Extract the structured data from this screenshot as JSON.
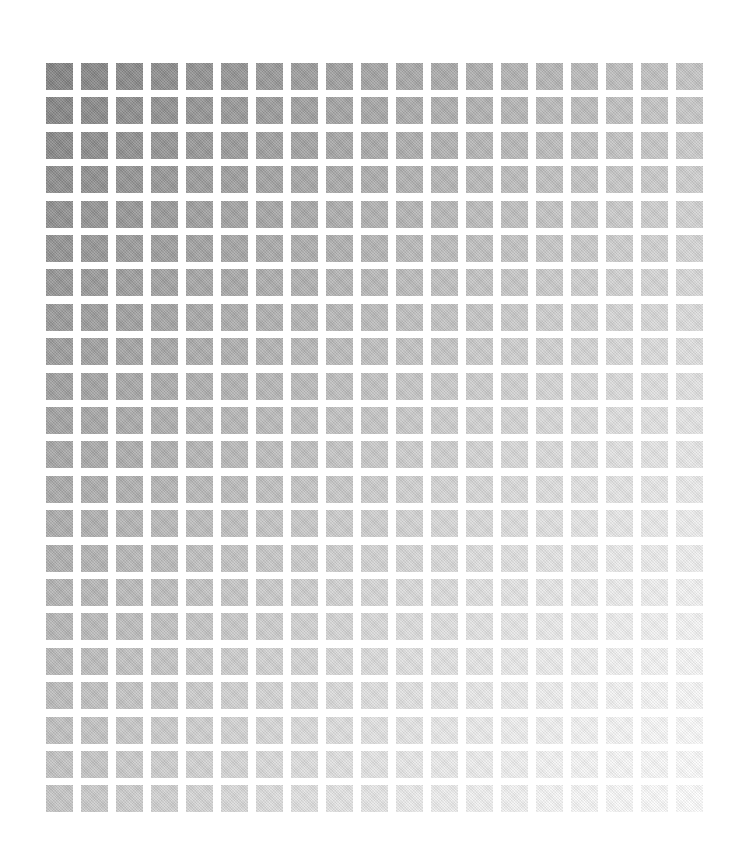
{
  "canvas": {
    "width": 752,
    "height": 859,
    "background": "#ffffff"
  },
  "grid": {
    "columns": 19,
    "rows": 22,
    "origin_x": 46,
    "origin_y": 63,
    "pitch_x": 35,
    "pitch_y": 34.4,
    "cell_width": 27,
    "cell_height": 27,
    "corner_gray_levels": {
      "top_left": 130,
      "top_right": 196,
      "bottom_left": 198,
      "bottom_right": 252
    },
    "falloff_exponent": 1.35,
    "corner_colors": {
      "top_left": "#828282",
      "top_right": "#c4c4c4",
      "bottom_left": "#c6c6c6",
      "bottom_right": "#fcfcfc"
    }
  }
}
